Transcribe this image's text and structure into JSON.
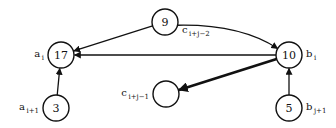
{
  "diagram": {
    "nodes": [
      {
        "id": "n17",
        "value": "17",
        "label": "a",
        "label_sub": "i",
        "label_side": "left"
      },
      {
        "id": "n3",
        "value": "3",
        "label": "a",
        "label_sub": "i+1",
        "label_side": "left"
      },
      {
        "id": "n9",
        "value": "9",
        "label": "c",
        "label_sub": "i+j−2",
        "label_side": "below-right"
      },
      {
        "id": "n10",
        "value": "10",
        "label": "b",
        "label_sub": "i",
        "label_side": "right"
      },
      {
        "id": "nempty",
        "value": "",
        "label": "c",
        "label_sub": "i+j−1",
        "label_side": "left"
      },
      {
        "id": "n5",
        "value": "5",
        "label": "b",
        "label_sub": "j+1",
        "label_side": "right"
      }
    ],
    "edges": [
      {
        "from": "n3",
        "to": "n17",
        "style": "normal"
      },
      {
        "from": "n9",
        "to": "n17",
        "style": "normal"
      },
      {
        "from": "n10",
        "to": "n17",
        "style": "normal"
      },
      {
        "from": "n9",
        "to": "n10",
        "style": "curved"
      },
      {
        "from": "n10",
        "to": "nempty",
        "style": "bold"
      },
      {
        "from": "n5",
        "to": "n10",
        "style": "normal"
      }
    ]
  }
}
